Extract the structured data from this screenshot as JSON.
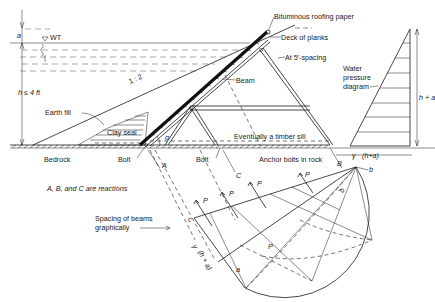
{
  "labels": {
    "a_top": "a",
    "wt": "WT",
    "h_limit": "h ≤ 4 ft",
    "slope": "1 : 2",
    "earth_fill": "Earth fill",
    "clay_seal": "Clay seal",
    "bedrock": "Bedrock",
    "bolt_left": "Bolt",
    "bolt_mid": "Bolt",
    "alpha": "α",
    "reaction_a": "A",
    "reaction_b": "B",
    "reaction_c": "C",
    "bituminous": "Bituminous roofing paper",
    "deck": "Deck of planks",
    "beam": "Beam",
    "spacing": "At 5′-spacing",
    "water_pressure_1": "Water",
    "water_pressure_2": "pressure",
    "water_pressure_3": "diagram",
    "h_plus_a": "h + a",
    "sill": "Eventually a timber sill",
    "anchor": "Anchor bolts in rock",
    "gamma": "γ",
    "gamma_expr": "(h+a)",
    "reactions_note": "A, B, and C are reactions",
    "spacing_graph_1": "Spacing of beams",
    "spacing_graph_2": "graphically",
    "p": "P",
    "c_small": "c",
    "a_small": "a",
    "b_small": "b",
    "gamma_side": "γ",
    "gamma_side_expr": "(h + a)",
    "half_p": "P",
    "half_2": "2"
  }
}
